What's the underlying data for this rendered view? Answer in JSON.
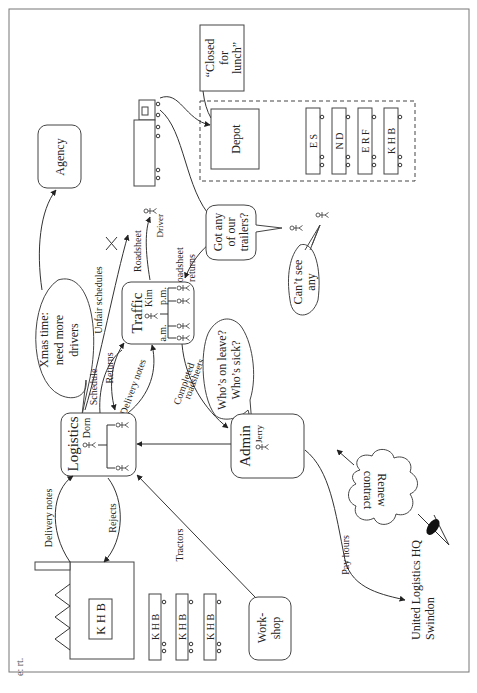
{
  "diagram": {
    "type": "rich-picture",
    "orientation": "rotated-90-ccw",
    "nodes": {
      "agency": "Agency",
      "closed_for_lunch": "“Closed for lunch”",
      "closed_lines": [
        "“Closed",
        "for",
        "lunch”"
      ],
      "depot": "Depot",
      "traffic": "Traffic",
      "traffic_person": "Kim",
      "traffic_am": "a.m.",
      "traffic_pm": "p.m.",
      "logistics": "Logistics",
      "logistics_person": "Dorn",
      "admin": "Admin",
      "admin_person": "Jerry",
      "workshop_lines": [
        "Work-",
        "shop"
      ],
      "hq_lines": [
        "United Logistics HQ",
        "Swindon"
      ],
      "driver": "Driver",
      "factory_sign": "K H B"
    },
    "trailers_depot": [
      "E S",
      "N D",
      "E R F",
      "K H B"
    ],
    "trailers_factory": [
      "K H B",
      "K H B",
      "K H B"
    ],
    "bubbles": {
      "xmas": [
        "Xmas time:",
        "need more",
        "drivers"
      ],
      "got_trailers": [
        "Got any",
        "of our",
        "trailers?"
      ],
      "cant_see": [
        "Can’t see",
        "any"
      ],
      "who_leave": [
        "Who’s on leave?",
        "Who’s sick?"
      ],
      "renew": [
        "Renew",
        "contract"
      ]
    },
    "flows": {
      "unfair_schedules": "Unfair schedules",
      "roadsheet": "Roadsheet",
      "roadsheet_returns": [
        "Roadsheet",
        "returns"
      ],
      "schedule": "Schedule",
      "returns": "Returns",
      "delivery_notes_traffic": "Delivery notes",
      "completed_roadsheets": [
        "Completed",
        "roadsheets"
      ],
      "delivery_notes_factory": "Delivery notes",
      "rejects": "Rejects",
      "tractors": "Tractors",
      "pay_hours": "Pay hours"
    },
    "margin_fragment": [
      "e:",
      "rt."
    ]
  }
}
